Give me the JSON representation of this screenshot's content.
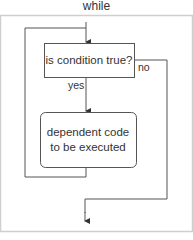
{
  "diagram": {
    "title": "while",
    "nodes": {
      "condition": {
        "label": "is  condition true?",
        "shape": "rectangle"
      },
      "action": {
        "line1": "dependent code",
        "line2": "to be executed",
        "shape": "rounded-rectangle"
      }
    },
    "edges": {
      "yes_label": "yes",
      "no_label": "no"
    },
    "colors": {
      "stroke": "#555555",
      "frame": "#cccccc",
      "text": "#333333"
    }
  }
}
